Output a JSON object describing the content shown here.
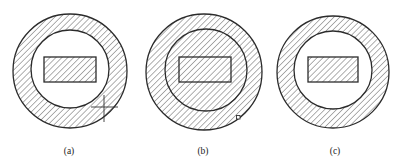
{
  "figure": {
    "panels": [
      {
        "id": "a",
        "label": "(a)",
        "outer_circle": {
          "cx": 70,
          "cy": 71,
          "r": 57
        },
        "inner_circle": {
          "cx": 70,
          "cy": 69,
          "r": 39
        },
        "rect": {
          "x": 44,
          "y": 57,
          "w": 52,
          "h": 25
        },
        "hatched_regions": [
          "annulus",
          "rect"
        ],
        "marker": {
          "type": "crosshair",
          "x": 104,
          "y": 107
        }
      },
      {
        "id": "b",
        "label": "(b)",
        "outer_circle": {
          "cx": 204,
          "cy": 72,
          "r": 58
        },
        "inner_circle": {
          "cx": 206,
          "cy": 70,
          "r": 41
        },
        "rect": {
          "x": 179,
          "y": 57,
          "w": 52,
          "h": 25
        },
        "hatched_regions": [
          "full-disk"
        ],
        "marker": {
          "type": "small-square",
          "x": 238,
          "y": 117
        }
      },
      {
        "id": "c",
        "label": "(c)",
        "outer_circle": {
          "cx": 333,
          "cy": 72,
          "r": 56
        },
        "inner_circle": {
          "cx": 333,
          "cy": 70,
          "r": 39
        },
        "rect": {
          "x": 308,
          "y": 57,
          "w": 50,
          "h": 25
        },
        "hatched_regions": [
          "annulus",
          "rect"
        ],
        "marker": null
      }
    ],
    "colors": {
      "stroke": "#2b2b2b",
      "hatch": "#444444",
      "background": "#ffffff"
    }
  }
}
